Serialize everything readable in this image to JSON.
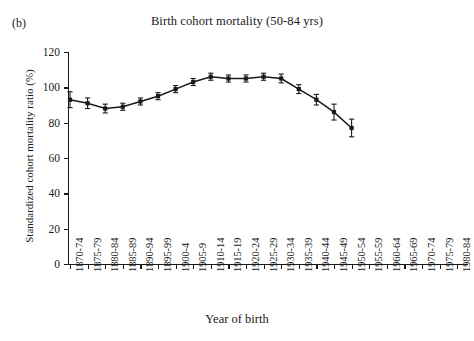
{
  "figure": {
    "panel_letter": "(b)",
    "title": "Birth cohort mortality (50-84 yrs)"
  },
  "chart_data": {
    "type": "line",
    "title": "Birth cohort mortality (50-84 yrs)",
    "xlabel": "Year of birth",
    "ylabel": "Standardized cohort mortality ratio (%)",
    "ylim": [
      0,
      120
    ],
    "ytick_values": [
      0,
      20,
      40,
      60,
      80,
      100,
      120
    ],
    "grid": false,
    "legend": "none",
    "error_bars": true,
    "categories": [
      "1870-74",
      "1875-79",
      "1880-84",
      "1885-89",
      "1890-94",
      "1895-99",
      "1900-4",
      "1905-9",
      "1910-14",
      "1915-19",
      "1920-24",
      "1925-29",
      "1930-34",
      "1935-39",
      "1940-44",
      "1945-49",
      "1950-54",
      "1955-59",
      "1960-64",
      "1965-69",
      "1970-74",
      "1975-79",
      "1980-84"
    ],
    "series": [
      {
        "name": "Standardized cohort mortality ratio",
        "x": [
          "1870-74",
          "1875-79",
          "1880-84",
          "1885-89",
          "1890-94",
          "1895-99",
          "1900-4",
          "1905-9",
          "1910-14",
          "1915-19",
          "1920-24",
          "1925-29",
          "1930-34",
          "1935-39",
          "1940-44",
          "1945-49"
        ],
        "values": [
          93,
          91,
          88,
          89,
          92,
          95,
          99,
          103,
          106,
          105,
          105,
          106,
          105,
          99,
          93,
          86
        ],
        "errors": [
          4.5,
          3.0,
          2.5,
          2.0,
          2.0,
          2.0,
          2.0,
          2.0,
          2.0,
          2.0,
          2.0,
          2.0,
          2.5,
          2.5,
          3.0,
          4.5
        ]
      }
    ],
    "last_point": {
      "x": "1945-49",
      "value": 77,
      "error": 5.0
    },
    "marker": "square",
    "line_color": "#1a1a1a"
  }
}
